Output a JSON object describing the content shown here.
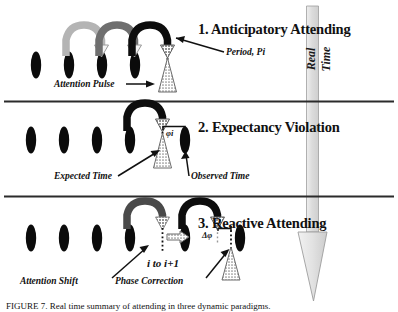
{
  "figure": {
    "caption": "FIGURE 7. Real time summary of attending in three dynamic paradigms.",
    "time_axis_label": "Real Time"
  },
  "panels": [
    {
      "number": "1.",
      "title": "1. Anticipatory Attending",
      "labels": {
        "period": "Period,  Pi",
        "pulse": "Attention Pulse"
      },
      "tone_count": 4,
      "arc_count": 3
    },
    {
      "number": "2.",
      "title": "2. Expectancy Violation",
      "labels": {
        "phi": "φi",
        "expected": "Expected Time",
        "observed": "Observed Time"
      },
      "tone_count": 5,
      "arc_count": 1
    },
    {
      "number": "3.",
      "title": "3. Reactive Attending",
      "labels": {
        "index_shift": "i  to  i+1",
        "delta_phi": "Δφ",
        "attention_shift": "Attention Shift",
        "phase_correction": "Phase Correction"
      },
      "tone_count": 6,
      "arc_count": 2
    }
  ],
  "colors": {
    "ink": "#111111",
    "tone_fill": "#0b0b0b",
    "arc_light": "#b4b4b4",
    "arc_mid": "#6f6f6f",
    "arc_dark": "#0d0d0d",
    "pulse_fill": "#9a9a9a",
    "timeline_arrow": "#d8d8d8",
    "divider": "#2b2b2b"
  }
}
